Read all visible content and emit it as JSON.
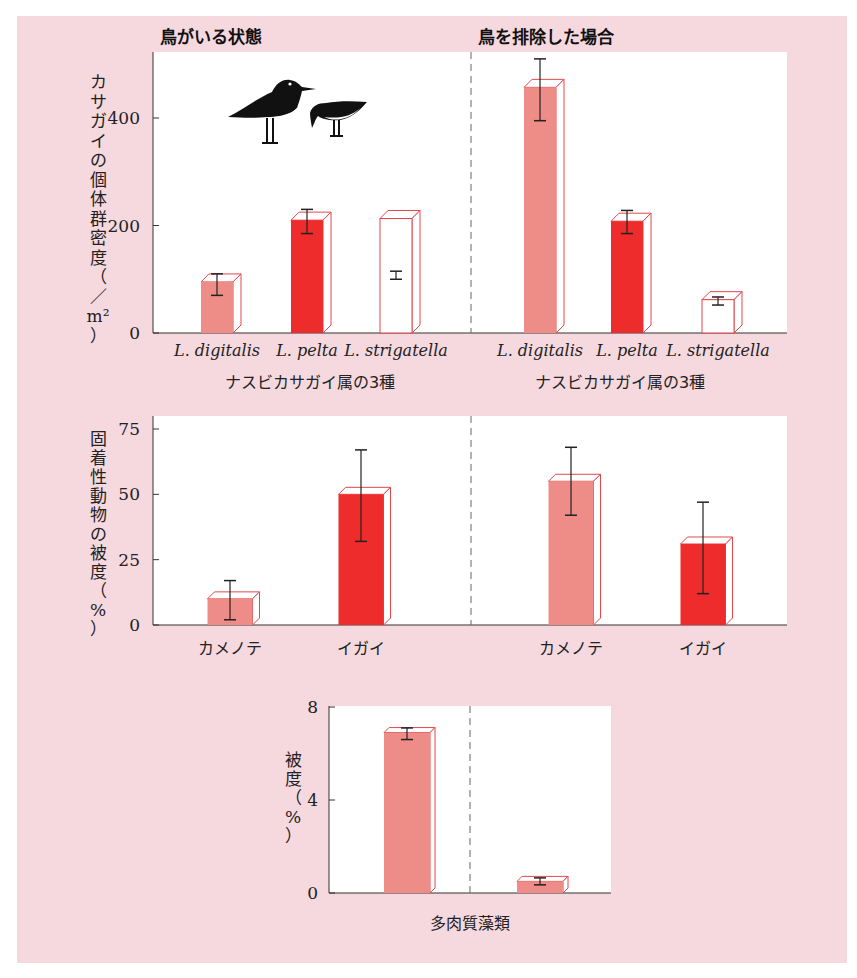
{
  "colors": {
    "background_panel": "#f6d8df",
    "plot_bg": "#ffffff",
    "light_red": "#ee8c88",
    "bright_red": "#ef2c2c",
    "outline_red": "#e0484c",
    "open_bar": "#ffffff",
    "axis": "#333333",
    "divider": "#666666"
  },
  "headers": {
    "left": "鳥がいる状態",
    "right": "鳥を排除した場合"
  },
  "chart_data": [
    {
      "type": "bar",
      "title": "カサガイの個体群密度",
      "ylabel": "カサガイの個体群密度（／m²）",
      "ylabel_chars": [
        "カ",
        "サ",
        "ガ",
        "イ",
        "の",
        "個",
        "体",
        "群",
        "密",
        "度",
        "（",
        "／",
        "m²",
        "）"
      ],
      "xlabel": "ナスビカサガイ属の3種",
      "ylim": [
        0,
        500
      ],
      "yticks": [
        0,
        200,
        400
      ],
      "categories": [
        "L. digitalis",
        "L. pelta",
        "L. strigatella"
      ],
      "groups": [
        "鳥がいる状態",
        "鳥を排除した場合"
      ],
      "series": [
        {
          "name": "鳥がいる状態",
          "values": [
            95,
            210,
            213
          ],
          "error_low": [
            70,
            185,
            100
          ],
          "error_high": [
            110,
            230,
            115
          ],
          "styles": [
            "light",
            "bright",
            "open"
          ]
        },
        {
          "name": "鳥を排除した場合",
          "values": [
            457,
            208,
            62
          ],
          "error_low": [
            395,
            185,
            52
          ],
          "error_high": [
            510,
            228,
            67
          ],
          "styles": [
            "light",
            "bright",
            "open"
          ]
        }
      ],
      "annotation": "bird silhouettes (oystercatchers) in left panel"
    },
    {
      "type": "bar",
      "title": "固着性動物の被度",
      "ylabel": "固着性動物の被度（%）",
      "ylabel_chars": [
        "固",
        "着",
        "性",
        "動",
        "物",
        "の",
        "被",
        "度",
        "（",
        "%",
        "）"
      ],
      "xlabel": "",
      "ylim": [
        0,
        80
      ],
      "yticks": [
        0,
        25,
        50,
        75
      ],
      "categories": [
        "カメノテ",
        "イガイ"
      ],
      "groups": [
        "鳥がいる状態",
        "鳥を排除した場合"
      ],
      "series": [
        {
          "name": "鳥がいる状態",
          "values": [
            10,
            50
          ],
          "error_low": [
            2,
            32
          ],
          "error_high": [
            17,
            67
          ],
          "styles": [
            "light",
            "bright"
          ]
        },
        {
          "name": "鳥を排除した場合",
          "values": [
            55,
            31
          ],
          "error_low": [
            42,
            12
          ],
          "error_high": [
            68,
            47
          ],
          "styles": [
            "light",
            "bright"
          ]
        }
      ]
    },
    {
      "type": "bar",
      "title": "多肉質藻類の被度",
      "ylabel": "被度（%）",
      "ylabel_chars": [
        "被",
        "度",
        "（",
        "%",
        "）"
      ],
      "xlabel": "多肉質藻類",
      "ylim": [
        0,
        8
      ],
      "yticks": [
        0,
        4,
        8
      ],
      "categories": [
        "多肉質藻類"
      ],
      "groups": [
        "鳥がいる状態",
        "鳥を排除した場合"
      ],
      "series": [
        {
          "name": "鳥がいる状態",
          "values": [
            6.9
          ],
          "error_low": [
            6.6
          ],
          "error_high": [
            7.1
          ],
          "styles": [
            "light"
          ]
        },
        {
          "name": "鳥を排除した場合",
          "values": [
            0.5
          ],
          "error_low": [
            0.35
          ],
          "error_high": [
            0.65
          ],
          "styles": [
            "light"
          ]
        }
      ]
    }
  ]
}
